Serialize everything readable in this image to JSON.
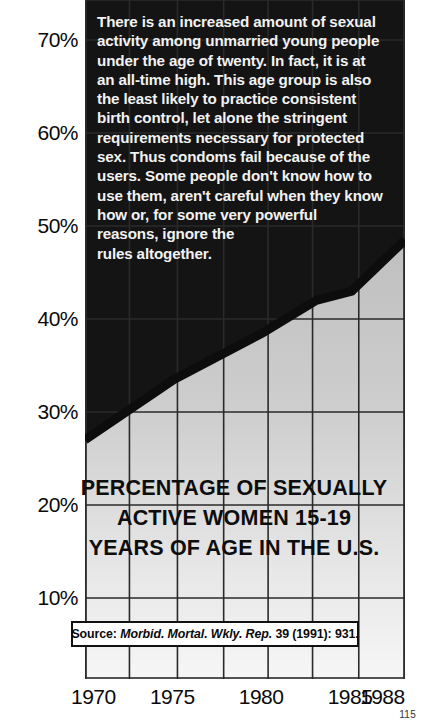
{
  "page": {
    "page_number": "115",
    "background_color": "#ffffff"
  },
  "narrative": {
    "text": "There is an increased amount of sexual\nactivity among unmarried young people\nunder the age of twenty.  In fact, it is at\nan all-time high.  This age group is also\nthe least likely to practice consistent\nbirth control, let alone the stringent\nrequirements necessary for protected\nsex.  Thus condoms fail because of the\nusers.  Some people don't know how to\nuse them, aren't careful when they know\nhow or, for some very powerful\nreasons, ignore the\nrules altogether.",
    "text_color": "#f2f2f2"
  },
  "title": {
    "line1": "PERCENTAGE OF SEXUALLY",
    "line2": "ACTIVE  WOMEN 15-19",
    "line3": "YEARS OF AGE IN THE U.S.",
    "color": "#0d0d0d"
  },
  "source": {
    "label": "Source:",
    "journal": "Morbid. Mortal. Wkly. Rep.",
    "citation": "39 (1991): 931."
  },
  "chart_data": {
    "type": "line",
    "title": "PERCENTAGE OF SEXUALLY ACTIVE WOMEN 15-19 YEARS OF AGE IN THE U.S.",
    "xlabel": "",
    "ylabel": "",
    "xlim": [
      1970,
      1988
    ],
    "ylim": [
      0,
      75
    ],
    "grid": true,
    "legend": "none",
    "y_ticks": [
      {
        "label": "70%",
        "value": 70
      },
      {
        "label": "60%",
        "value": 60
      },
      {
        "label": "50%",
        "value": 50
      },
      {
        "label": "40%",
        "value": 40
      },
      {
        "label": "30%",
        "value": 30
      },
      {
        "label": "20%",
        "value": 20
      },
      {
        "label": "10%",
        "value": 10
      }
    ],
    "x_ticks": [
      {
        "label": "1970",
        "value": 1970
      },
      {
        "label": "1975",
        "value": 1975
      },
      {
        "label": "1980",
        "value": 1980
      },
      {
        "label": "1985",
        "value": 1985
      },
      {
        "label": "1988",
        "value": 1988
      }
    ],
    "x_gridline_values": [
      1970,
      1972.5,
      1975.2,
      1977.8,
      1980.3,
      1982.8,
      1985.4,
      1988
    ],
    "x": [
      1970,
      1975,
      1980,
      1983,
      1985,
      1988
    ],
    "series": [
      {
        "name": "Percentage of sexually active women 15-19",
        "values": [
          27.0,
          33.5,
          38.5,
          42.0,
          43.0,
          48.5
        ],
        "color": "#0d0d0d",
        "line_width": 9,
        "fill_above_color": "#141414",
        "fill_below_color": "#c4c4c4"
      }
    ],
    "annotations": [
      {
        "kind": "text-block",
        "text": "narrative paragraph overlaid on dark region"
      },
      {
        "kind": "source-box",
        "text": "Source: Morbid. Mortal. Wkly. Rep. 39 (1991): 931."
      }
    ]
  }
}
